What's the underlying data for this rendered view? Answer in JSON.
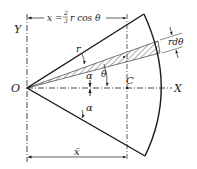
{
  "figure": {
    "labels": {
      "origin": "O",
      "y_axis": "Y",
      "x_axis": "X",
      "centroid": "C",
      "radius": "r",
      "strip_width": "rdθ",
      "theta": "θ",
      "alpha_upper": "α",
      "alpha_lower": "α",
      "top_dimension": "x = ⅔ r cos θ",
      "top_dim_x": "x =",
      "top_dim_frac_num": "2",
      "top_dim_frac_den": "3",
      "top_dim_rest": "r cos θ",
      "bottom_dimension": "x̄"
    },
    "colors": {
      "ink": "#1a1a1a",
      "background": "#ffffff"
    }
  }
}
